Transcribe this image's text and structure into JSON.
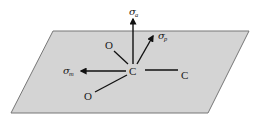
{
  "diagram": {
    "plane": {
      "fill": "#d4d4d4",
      "stroke": "#777777",
      "corners": [
        [
          53,
          31
        ],
        [
          249,
          31
        ],
        [
          208,
          113
        ],
        [
          11,
          113
        ]
      ]
    },
    "atoms": [
      {
        "id": "c-central",
        "label": "C",
        "x": 133,
        "y": 74
      },
      {
        "id": "c-right",
        "label": "C",
        "x": 185,
        "y": 78
      },
      {
        "id": "o-top",
        "label": "O",
        "x": 109,
        "y": 48
      },
      {
        "id": "o-bottom",
        "label": "O",
        "x": 88,
        "y": 99
      }
    ],
    "tensor_labels": [
      {
        "id": "sigma-a",
        "symbol": "σ",
        "subscript": "a",
        "x": 130,
        "y": 15
      },
      {
        "id": "sigma-p",
        "symbol": "σ",
        "subscript": "p",
        "x": 159,
        "y": 39
      },
      {
        "id": "sigma-m",
        "symbol": "σ",
        "subscript": "m",
        "x": 63,
        "y": 74
      }
    ],
    "arrow_color": "#111111",
    "bond_color": "#111111"
  }
}
